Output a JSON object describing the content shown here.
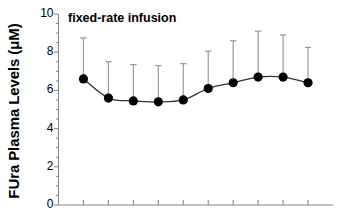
{
  "figure": {
    "title": "fixed-rate infusion",
    "ylabel": "FUra Plasma Levels (μM)",
    "marker_color": "#000000",
    "line_color": "#333333",
    "errorbar_color": "#999999",
    "axis_color": "#888888",
    "background": "#ffffff"
  },
  "chart_data": {
    "type": "line",
    "title": "fixed-rate infusion",
    "xlabel": "",
    "ylabel": "FUra Plasma Levels (μM)",
    "ylim": [
      0,
      10
    ],
    "yticks": [
      0,
      2,
      4,
      6,
      8,
      10
    ],
    "ytick_labels": [
      "0",
      "2",
      "4",
      "6",
      "8",
      "10"
    ],
    "y_minor_tick_step": 0.5,
    "grid": false,
    "legend": false,
    "xlim": [
      0,
      11
    ],
    "xticks": [
      1,
      2,
      3,
      4,
      5,
      6,
      7,
      8,
      9,
      10
    ],
    "xtick_labels": [
      "",
      "",
      "",
      "",
      "",
      "",
      "",
      "",
      "",
      ""
    ],
    "x": [
      1,
      2,
      3,
      4,
      5,
      6,
      7,
      8,
      9,
      10
    ],
    "values": [
      6.6,
      5.6,
      5.45,
      5.4,
      5.5,
      6.1,
      6.4,
      6.7,
      6.7,
      6.4
    ],
    "error_upper": [
      8.75,
      7.5,
      7.35,
      7.3,
      7.4,
      8.05,
      8.6,
      9.1,
      8.9,
      8.25
    ],
    "error_bars": "upper-only",
    "series": [
      {
        "name": "FUra plasma level",
        "values": [
          6.6,
          5.6,
          5.45,
          5.4,
          5.5,
          6.1,
          6.4,
          6.7,
          6.7,
          6.4
        ]
      }
    ],
    "marker": "filled-circle",
    "line_style": "smooth-solid"
  }
}
